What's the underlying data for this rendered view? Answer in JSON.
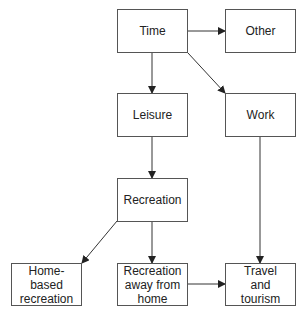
{
  "diagram": {
    "nodes": [
      {
        "id": "time",
        "label": "Time",
        "x": 117,
        "y": 9,
        "w": 71,
        "h": 44
      },
      {
        "id": "other",
        "label": "Other",
        "x": 225,
        "y": 9,
        "w": 71,
        "h": 44
      },
      {
        "id": "leisure",
        "label": "Leisure",
        "x": 117,
        "y": 93,
        "w": 71,
        "h": 44
      },
      {
        "id": "work",
        "label": "Work",
        "x": 225,
        "y": 93,
        "w": 71,
        "h": 44
      },
      {
        "id": "recreation",
        "label": "Recreation",
        "x": 117,
        "y": 178,
        "w": 71,
        "h": 44
      },
      {
        "id": "home_based",
        "label": "Home-based recreation",
        "x": 11,
        "y": 263,
        "w": 71,
        "h": 43
      },
      {
        "id": "away",
        "label": "Recreation away from home",
        "x": 117,
        "y": 263,
        "w": 71,
        "h": 43
      },
      {
        "id": "travel",
        "label": "Travel and tourism",
        "x": 225,
        "y": 263,
        "w": 71,
        "h": 43
      }
    ],
    "edges": [
      {
        "from": "time",
        "to": "other"
      },
      {
        "from": "time",
        "to": "leisure"
      },
      {
        "from": "time",
        "to": "work"
      },
      {
        "from": "leisure",
        "to": "recreation"
      },
      {
        "from": "work",
        "to": "travel"
      },
      {
        "from": "recreation",
        "to": "home_based"
      },
      {
        "from": "recreation",
        "to": "away"
      },
      {
        "from": "away",
        "to": "travel"
      }
    ]
  }
}
